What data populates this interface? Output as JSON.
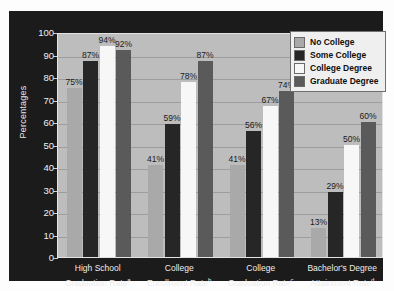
{
  "chart_data": {
    "type": "bar",
    "title": "",
    "xlabel": "",
    "ylabel": "Percentages",
    "ylim": [
      0,
      100
    ],
    "yticks": [
      0,
      10,
      20,
      30,
      40,
      50,
      60,
      70,
      80,
      90,
      100
    ],
    "grid": true,
    "legend_position": "top-right",
    "categories": [
      "High School\nGraduation Rate<sup>a</sup>",
      "College\nEnrollment Rate<sup>b</sup>",
      "College\nGraduation Rate<sup>c</sup>",
      "Bachelor's Degree\nAttainment Rate<sup>d</sup>"
    ],
    "category_lines": [
      {
        "line1": "High School",
        "line2": "Graduation Rate",
        "note": "a"
      },
      {
        "line1": "College",
        "line2": "Enrollment Rate",
        "note": "b"
      },
      {
        "line1": "College",
        "line2": "Graduation Rate",
        "note": "c"
      },
      {
        "line1": "Bachelor's Degree",
        "line2": "Attainment Rate",
        "note": "d"
      }
    ],
    "series": [
      {
        "name": "No College",
        "color": "#a9a9a9",
        "values": [
          75,
          41,
          41,
          13
        ],
        "labels": [
          "75%",
          "41%",
          "41%",
          "13%"
        ]
      },
      {
        "name": "Some College",
        "color": "#262626",
        "values": [
          87,
          59,
          56,
          29
        ],
        "labels": [
          "87%",
          "59%",
          "56%",
          "29%"
        ]
      },
      {
        "name": "College Degree",
        "color": "#f7f7f7",
        "values": [
          94,
          78,
          67,
          50
        ],
        "labels": [
          "94%",
          "78%",
          "67%",
          "50%"
        ]
      },
      {
        "name": "Graduate Degree",
        "color": "#5a5a5a",
        "values": [
          92,
          87,
          74,
          60
        ],
        "labels": [
          "92%",
          "87%",
          "74%",
          "60%"
        ]
      }
    ]
  },
  "colors": {
    "panel_background": "#1b1b1b",
    "plot_background": "#bdbdbd",
    "gridline": "#9d9d9d",
    "axis_text": "#efefef",
    "legend_background": "#efefef"
  }
}
